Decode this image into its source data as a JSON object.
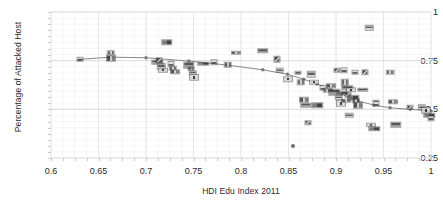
{
  "chart_data": {
    "type": "scatter",
    "title": "",
    "xlabel": "HDI Edu Index 2011",
    "ylabel": "Percentage of Attacked Host",
    "xlim": [
      0.6,
      1.0
    ],
    "ylim": [
      0.25,
      1.0
    ],
    "xticks": [
      0.6,
      0.65,
      0.7,
      0.75,
      0.8,
      0.85,
      0.9,
      0.95,
      1
    ],
    "xticklabels": [
      "0.6",
      "0.65",
      "0.7",
      "0.75",
      "0.8",
      "0.85",
      "0.9",
      "0.95",
      "1"
    ],
    "yticks": [
      0.25,
      0.5,
      0.75,
      1
    ],
    "yticklabels": [
      "0.25",
      "0.5",
      "0.75",
      "1"
    ],
    "grid": true,
    "minor_grid": true,
    "legend": "none",
    "marker_style": "country-flag-image",
    "points": [
      {
        "x": 0.63,
        "y": 0.757
      },
      {
        "x": 0.663,
        "y": 0.79
      },
      {
        "x": 0.663,
        "y": 0.762
      },
      {
        "x": 0.712,
        "y": 0.742
      },
      {
        "x": 0.714,
        "y": 0.752
      },
      {
        "x": 0.716,
        "y": 0.722
      },
      {
        "x": 0.718,
        "y": 0.7
      },
      {
        "x": 0.722,
        "y": 0.845
      },
      {
        "x": 0.726,
        "y": 0.733
      },
      {
        "x": 0.728,
        "y": 0.712
      },
      {
        "x": 0.731,
        "y": 0.694
      },
      {
        "x": 0.745,
        "y": 0.727
      },
      {
        "x": 0.747,
        "y": 0.708
      },
      {
        "x": 0.749,
        "y": 0.688
      },
      {
        "x": 0.751,
        "y": 0.666
      },
      {
        "x": 0.76,
        "y": 0.735
      },
      {
        "x": 0.772,
        "y": 0.742
      },
      {
        "x": 0.786,
        "y": 0.73
      },
      {
        "x": 0.795,
        "y": 0.79
      },
      {
        "x": 0.823,
        "y": 0.8
      },
      {
        "x": 0.838,
        "y": 0.757
      },
      {
        "x": 0.841,
        "y": 0.7
      },
      {
        "x": 0.849,
        "y": 0.655
      },
      {
        "x": 0.855,
        "y": 0.313
      },
      {
        "x": 0.86,
        "y": 0.688
      },
      {
        "x": 0.863,
        "y": 0.64
      },
      {
        "x": 0.866,
        "y": 0.548
      },
      {
        "x": 0.868,
        "y": 0.52
      },
      {
        "x": 0.87,
        "y": 0.432
      },
      {
        "x": 0.874,
        "y": 0.68
      },
      {
        "x": 0.877,
        "y": 0.64
      },
      {
        "x": 0.88,
        "y": 0.52
      },
      {
        "x": 0.886,
        "y": 0.61
      },
      {
        "x": 0.891,
        "y": 0.596
      },
      {
        "x": 0.895,
        "y": 0.62
      },
      {
        "x": 0.898,
        "y": 0.588
      },
      {
        "x": 0.901,
        "y": 0.7
      },
      {
        "x": 0.903,
        "y": 0.56
      },
      {
        "x": 0.905,
        "y": 0.53
      },
      {
        "x": 0.906,
        "y": 0.585
      },
      {
        "x": 0.908,
        "y": 0.7
      },
      {
        "x": 0.909,
        "y": 0.64
      },
      {
        "x": 0.91,
        "y": 0.545
      },
      {
        "x": 0.912,
        "y": 0.61
      },
      {
        "x": 0.913,
        "y": 0.575
      },
      {
        "x": 0.914,
        "y": 0.47
      },
      {
        "x": 0.916,
        "y": 0.6
      },
      {
        "x": 0.918,
        "y": 0.56
      },
      {
        "x": 0.92,
        "y": 0.69
      },
      {
        "x": 0.921,
        "y": 0.545
      },
      {
        "x": 0.923,
        "y": 0.52
      },
      {
        "x": 0.928,
        "y": 0.6
      },
      {
        "x": 0.931,
        "y": 0.69
      },
      {
        "x": 0.935,
        "y": 0.92
      },
      {
        "x": 0.937,
        "y": 0.42
      },
      {
        "x": 0.94,
        "y": 0.4
      },
      {
        "x": 0.942,
        "y": 0.53
      },
      {
        "x": 0.957,
        "y": 0.69
      },
      {
        "x": 0.96,
        "y": 0.54
      },
      {
        "x": 0.963,
        "y": 0.42
      },
      {
        "x": 0.978,
        "y": 0.51
      },
      {
        "x": 0.99,
        "y": 0.51
      },
      {
        "x": 0.995,
        "y": 0.495
      },
      {
        "x": 0.998,
        "y": 0.47
      },
      {
        "x": 1.0,
        "y": 0.455
      }
    ],
    "trend_line": {
      "name": "fitted trend",
      "color": "#888888",
      "points": [
        {
          "x": 0.63,
          "y": 0.757
        },
        {
          "x": 0.663,
          "y": 0.768
        },
        {
          "x": 0.7,
          "y": 0.765
        },
        {
          "x": 0.745,
          "y": 0.748
        },
        {
          "x": 0.786,
          "y": 0.727
        },
        {
          "x": 0.823,
          "y": 0.703
        },
        {
          "x": 0.849,
          "y": 0.68
        },
        {
          "x": 0.866,
          "y": 0.655
        },
        {
          "x": 0.88,
          "y": 0.63
        },
        {
          "x": 0.895,
          "y": 0.6
        },
        {
          "x": 0.906,
          "y": 0.578
        },
        {
          "x": 0.914,
          "y": 0.56
        },
        {
          "x": 0.923,
          "y": 0.543
        },
        {
          "x": 0.94,
          "y": 0.522
        },
        {
          "x": 0.957,
          "y": 0.508
        },
        {
          "x": 0.978,
          "y": 0.5
        },
        {
          "x": 1.0,
          "y": 0.492
        }
      ]
    }
  }
}
